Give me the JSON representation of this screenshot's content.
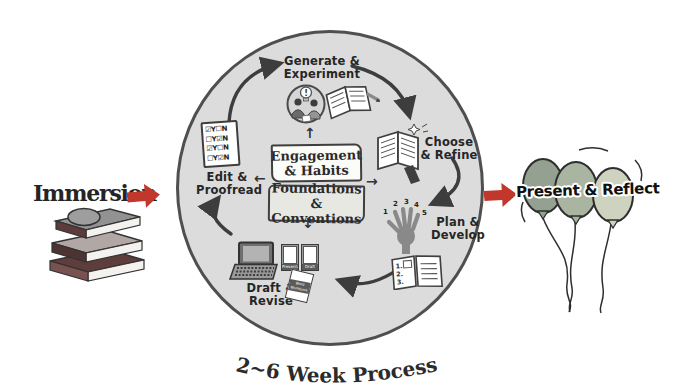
{
  "colors": {
    "background": "#ffffff",
    "circle_fill": "#dcdcdc",
    "circle_border": "#4f4f4f",
    "ink": "#3d3d3d",
    "accent_red": "#c2372c",
    "balloon_left": "#94a090",
    "balloon_mid": "#aab5a1",
    "balloon_right": "#ced3bf"
  },
  "immersion": {
    "label": "Immersion"
  },
  "present": {
    "label": "Present & Reflect"
  },
  "process": {
    "caption": "2~6 Week Process",
    "center_boxes": [
      {
        "label": "Engagement\n& Habits"
      },
      {
        "label": "Foundations &\nConventions"
      }
    ],
    "stages": [
      {
        "id": "generate",
        "label": "Generate &\nExperiment"
      },
      {
        "id": "choose",
        "label": "Choose\n& Refine"
      },
      {
        "id": "plan",
        "label": "Plan &\nDevelop"
      },
      {
        "id": "draft",
        "label": "Draft &\nRevise"
      },
      {
        "id": "edit",
        "label": "Edit &\nProofread"
      }
    ]
  },
  "icons": {
    "checklist_rows": [
      "☑Y☐N",
      "☐Y☑N",
      "☑Y☐N",
      "☐Y☑N"
    ],
    "bulb_mark": "!",
    "hand_numbers": [
      "1",
      "2",
      "3",
      "4",
      "5"
    ],
    "notebook_rows": [
      "1.",
      "2.",
      "3."
    ],
    "folder_labels": [
      "Presentation",
      "Draft"
    ],
    "booklet_label": "Word\nWorkbook",
    "mini_arrows": {
      "up": "↑",
      "left": "←",
      "right": "→",
      "down": "↓"
    }
  }
}
